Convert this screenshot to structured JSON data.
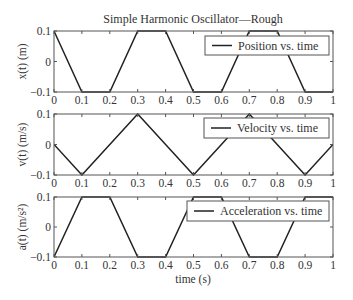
{
  "chart_data": [
    {
      "type": "line",
      "title": "Simple Harmonic Oscillator—Rough",
      "xlabel": "",
      "ylabel": "x(t) (m)",
      "xlim": [
        0,
        1
      ],
      "ylim": [
        -0.1,
        0.1
      ],
      "xticks": [
        "0",
        "0.1",
        "0.2",
        "0.3",
        "0.4",
        "0.5",
        "0.6",
        "0.7",
        "0.8",
        "0.9",
        "1"
      ],
      "yticks": [
        "−0.1",
        "0",
        "0.1"
      ],
      "legend": "Position vs. time",
      "legend_position": "upper right",
      "grid": false,
      "series": [
        {
          "name": "Position vs. time",
          "x": [
            0,
            0.1,
            0.2,
            0.3,
            0.4,
            0.5,
            0.6,
            0.7,
            0.8,
            0.9,
            1.0
          ],
          "y": [
            0.1,
            -0.1,
            -0.1,
            0.1,
            0.1,
            -0.1,
            -0.1,
            0.1,
            0.1,
            -0.1,
            -0.1
          ]
        }
      ]
    },
    {
      "type": "line",
      "title": "",
      "xlabel": "",
      "ylabel": "v(t) (m/s)",
      "xlim": [
        0,
        1
      ],
      "ylim": [
        -0.1,
        0.1
      ],
      "xticks": [
        "0",
        "0.1",
        "0.2",
        "0.3",
        "0.4",
        "0.5",
        "0.6",
        "0.7",
        "0.8",
        "0.9",
        "1"
      ],
      "yticks": [
        "−0.1",
        "0",
        "0.1"
      ],
      "legend": "Velocity vs. time",
      "legend_position": "upper right",
      "grid": false,
      "series": [
        {
          "name": "Velocity vs. time",
          "x": [
            0,
            0.1,
            0.3,
            0.5,
            0.7,
            0.9,
            1.0
          ],
          "y": [
            0,
            -0.1,
            0.1,
            -0.1,
            0.1,
            -0.1,
            0
          ]
        }
      ]
    },
    {
      "type": "line",
      "title": "",
      "xlabel": "time (s)",
      "ylabel": "a(t) (m/s²)",
      "xlim": [
        0,
        1
      ],
      "ylim": [
        -0.1,
        0.1
      ],
      "xticks": [
        "0",
        "0.1",
        "0.2",
        "0.3",
        "0.4",
        "0.5",
        "0.6",
        "0.7",
        "0.8",
        "0.9",
        "1"
      ],
      "yticks": [
        "−0.1",
        "0",
        "0.1"
      ],
      "legend": "Acceleration vs. time",
      "legend_position": "upper right",
      "grid": false,
      "series": [
        {
          "name": "Acceleration vs. time",
          "x": [
            0,
            0.1,
            0.2,
            0.3,
            0.4,
            0.5,
            0.6,
            0.7,
            0.8,
            0.9,
            1.0
          ],
          "y": [
            -0.1,
            0.1,
            0.1,
            -0.1,
            -0.1,
            0.1,
            0.1,
            -0.1,
            -0.1,
            0.1,
            0.1
          ]
        }
      ]
    }
  ],
  "figure": {
    "title": "Simple Harmonic Oscillator—Rough",
    "xlabel": "time (s)",
    "line_color": "#222222",
    "axis_color": "#555555"
  },
  "layout": {
    "left": 54,
    "right": 333,
    "panels": [
      {
        "top": 31,
        "bottom": 92,
        "legend": {
          "x": 205,
          "y": 36,
          "w": 124,
          "h": 19
        }
      },
      {
        "top": 114,
        "bottom": 175,
        "legend": {
          "x": 204,
          "y": 118,
          "w": 125,
          "h": 20
        }
      },
      {
        "top": 197,
        "bottom": 257,
        "legend": {
          "x": 187,
          "y": 201,
          "w": 142,
          "h": 20
        }
      }
    ]
  }
}
